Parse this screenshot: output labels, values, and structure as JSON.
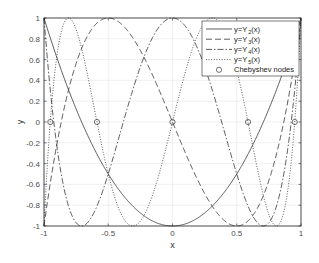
{
  "chart_data": {
    "type": "line",
    "title": "",
    "xlabel": "x",
    "ylabel": "y",
    "xlim": [
      -1,
      1
    ],
    "ylim": [
      -1,
      1
    ],
    "grid": true,
    "legend_position": "top-right (inside)",
    "xticks": [
      -1,
      -0.5,
      0,
      0.5,
      1
    ],
    "xtick_labels": [
      "-1",
      "-0.5",
      "0",
      "0.5",
      "1"
    ],
    "yticks": [
      -1,
      -0.8,
      -0.6,
      -0.4,
      -0.2,
      0,
      0.2,
      0.4,
      0.6,
      0.8,
      1
    ],
    "ytick_labels": [
      "-1",
      "-0.8",
      "-0.6",
      "-0.4",
      "-0.2",
      "0",
      "0.2",
      "0.4",
      "0.6",
      "0.8",
      "1"
    ],
    "series": [
      {
        "name": "y=Y_2(x)",
        "legend_main": "y=Y",
        "legend_sub": "2",
        "legend_tail": "(x)",
        "style": "solid",
        "formula": "2x^2-1",
        "coeffs": [
          -1,
          0,
          2
        ]
      },
      {
        "name": "y=Y_3(x)",
        "legend_main": "y=Y",
        "legend_sub": "3",
        "legend_tail": "(x)",
        "style": "dashed",
        "formula": "4x^3-3x",
        "coeffs": [
          0,
          -3,
          0,
          4
        ]
      },
      {
        "name": "y=Y_4(x)",
        "legend_main": "y=Y",
        "legend_sub": "4",
        "legend_tail": "(x)",
        "style": "dash-dot",
        "formula": "8x^4-8x^2+1",
        "coeffs": [
          1,
          0,
          -8,
          0,
          8
        ]
      },
      {
        "name": "y=Y_5(x)",
        "legend_main": "y=Y",
        "legend_sub": "5",
        "legend_tail": "(x)",
        "style": "dotted",
        "formula": "16x^5-20x^3+5x",
        "coeffs": [
          0,
          5,
          0,
          -20,
          0,
          16
        ]
      }
    ],
    "markers": {
      "name": "Chebyshev nodes",
      "symbol": "circle",
      "x": [
        -0.951,
        -0.588,
        0,
        0.588,
        0.951
      ],
      "y": [
        0,
        0,
        0,
        0,
        0
      ]
    }
  },
  "legend": {
    "items": [
      "y=Y_2(x)",
      "y=Y_3(x)",
      "y=Y_4(x)",
      "y=Y_5(x)",
      "Chebyshev nodes"
    ],
    "nodes_label": "Chebyshev nodes"
  },
  "colors": {
    "line": "#333333",
    "axes": "#262626",
    "grid": "#e6e6e6",
    "tick_text": "#4d4d4d"
  }
}
